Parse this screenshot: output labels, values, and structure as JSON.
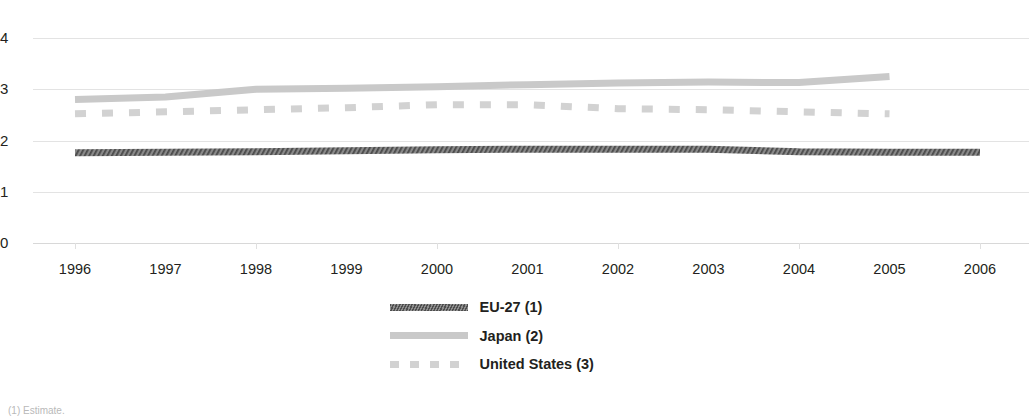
{
  "chart_data": {
    "type": "line",
    "title": "",
    "subtitle": "",
    "xlabel": "",
    "ylabel": "",
    "x": [
      1996,
      1997,
      1998,
      1999,
      2000,
      2001,
      2002,
      2003,
      2004,
      2005,
      2006
    ],
    "xtick_labels": [
      "1996",
      "1997",
      "1998",
      "1999",
      "2000",
      "2001",
      "2002",
      "2003",
      "2004",
      "2005",
      "2006"
    ],
    "ytick_labels": [
      "0",
      "1",
      "2",
      "3",
      "4"
    ],
    "ytick_values": [
      0,
      1,
      2,
      3,
      4
    ],
    "ylim": [
      0,
      4
    ],
    "xlim": [
      1996,
      2006
    ],
    "grid": true,
    "legend_position": "bottom-center",
    "series": [
      {
        "name": "EU-27 (1)",
        "style": "hatched-solid",
        "color": "#6b6b6b",
        "values": [
          1.76,
          1.77,
          1.78,
          1.8,
          1.82,
          1.83,
          1.83,
          1.83,
          1.78,
          1.77,
          1.77
        ]
      },
      {
        "name": "Japan (2)",
        "style": "solid",
        "color": "#c9c9c9",
        "values": [
          2.8,
          2.85,
          3.0,
          3.02,
          3.05,
          3.09,
          3.12,
          3.14,
          3.13,
          3.25,
          null
        ]
      },
      {
        "name": "United States (3)",
        "style": "dashed",
        "color": "#d2d2d2",
        "values": [
          2.52,
          2.56,
          2.6,
          2.64,
          2.7,
          2.7,
          2.62,
          2.6,
          2.56,
          2.52,
          null
        ]
      }
    ]
  },
  "legend": {
    "items": [
      {
        "label": "EU-27 (1)",
        "swatch": "eu-27-swatch"
      },
      {
        "label": "Japan (2)",
        "swatch": "japan-swatch"
      },
      {
        "label": "United States (3)",
        "swatch": "united-states-swatch"
      }
    ]
  },
  "footnote": {
    "text": "(1) Estimate."
  }
}
